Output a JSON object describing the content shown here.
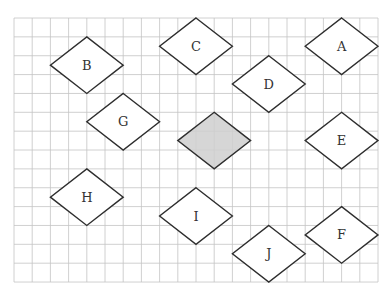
{
  "diagram": {
    "type": "grid-with-rhombuses",
    "grid": {
      "columns": 20,
      "rows": 14,
      "origin_px": [
        14,
        18
      ],
      "cell_px": [
        18.2,
        18.86
      ],
      "line_color": "#c4c4c4"
    },
    "shape_size_cells": {
      "width": 4,
      "height": 3
    },
    "stroke_color": "#2e2e2e",
    "shaded_fill": "#cfcfcf",
    "shapes": [
      {
        "label": "A",
        "center": [
          18,
          1.5
        ],
        "shaded": false
      },
      {
        "label": "B",
        "center": [
          4,
          2.5
        ],
        "shaded": false
      },
      {
        "label": "C",
        "center": [
          10,
          1.5
        ],
        "shaded": false
      },
      {
        "label": "D",
        "center": [
          14,
          3.5
        ],
        "shaded": false
      },
      {
        "label": "E",
        "center": [
          18,
          6.5
        ],
        "shaded": false
      },
      {
        "label": "F",
        "center": [
          18,
          11.5
        ],
        "shaded": false
      },
      {
        "label": "G",
        "center": [
          6,
          5.5
        ],
        "shaded": false
      },
      {
        "label": "H",
        "center": [
          4,
          9.5
        ],
        "shaded": false
      },
      {
        "label": "I",
        "center": [
          10,
          10.5
        ],
        "shaded": false
      },
      {
        "label": "J",
        "center": [
          14,
          12.5
        ],
        "shaded": false
      },
      {
        "label": "",
        "center": [
          11,
          6.5
        ],
        "shaded": true
      }
    ]
  }
}
